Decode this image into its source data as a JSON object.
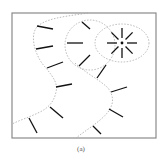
{
  "figure": {
    "caption": "(a)",
    "colors": {
      "frame": "#8a8a8a",
      "dashed": "#a8a8a8",
      "tick": "#111111",
      "background": "#ffffff"
    },
    "frame": {
      "x": 12,
      "y": 13,
      "width": 144,
      "height": 125
    },
    "boundaries": [
      {
        "name": "left-wavy-boundary",
        "path": "M 88 13 C 70 16, 40 18, 35 30 C 30 42, 38 60, 46 68 C 54 78, 58 84, 56 92 C 54 102, 48 108, 40 112 C 30 117, 20 120, 12 124"
      },
      {
        "name": "right-wavy-boundary",
        "path": "M 75 63 C 84 72, 100 80, 108 88 C 114 96, 114 104, 108 112 C 100 122, 86 130, 76 138"
      }
    ],
    "big_circle": {
      "cx": 90,
      "cy": 45,
      "rx": 25,
      "ry": 25
    },
    "small_ellipse": {
      "cx": 122,
      "cy": 43,
      "rx": 27,
      "ry": 19
    },
    "center_point": {
      "cx": 122,
      "cy": 43,
      "r": 1.4
    },
    "ticks": [
      [
        37,
        26,
        53,
        29
      ],
      [
        36,
        49,
        53,
        46
      ],
      [
        47,
        68,
        63,
        62
      ],
      [
        56,
        87,
        72,
        84
      ],
      [
        50,
        107,
        63,
        118
      ],
      [
        29,
        118,
        37,
        133
      ],
      [
        82,
        22,
        90,
        29
      ],
      [
        67,
        43,
        83,
        43
      ],
      [
        79,
        66,
        90,
        55
      ],
      [
        97,
        78,
        106,
        65
      ],
      [
        111,
        92,
        127,
        87
      ],
      [
        109,
        109,
        123,
        117
      ],
      [
        93,
        126,
        101,
        134
      ]
    ],
    "star": {
      "cx": 122,
      "cy": 43,
      "inner_r": 5,
      "outer_r": 15,
      "count": 8
    }
  }
}
